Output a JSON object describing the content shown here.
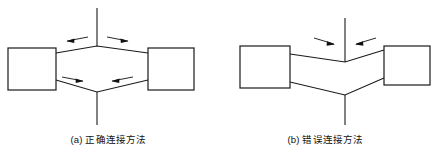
{
  "figure": {
    "background_color": "#ffffff",
    "line_color": "#1a1a1a",
    "arrow_color": "#111111",
    "width": 434,
    "height": 158
  },
  "panels": [
    {
      "id": "a",
      "caption": "(a) 正确连接方法",
      "diagram_type": "pipe-connection-schematic",
      "junction_shape": "diamond",
      "description_parts": {
        "left_box": "equipment-box-left",
        "right_box": "equipment-box-right",
        "top_riser": "vertical-pipe-top",
        "bottom_riser": "vertical-pipe-bottom"
      },
      "flow_arrows": [
        {
          "name": "top-left-arrow",
          "direction": "left",
          "position": "upper-left-branch"
        },
        {
          "name": "top-right-arrow",
          "direction": "right",
          "position": "upper-right-branch"
        },
        {
          "name": "bottom-left-arrow",
          "direction": "right",
          "position": "lower-left-branch"
        },
        {
          "name": "bottom-right-arrow",
          "direction": "left",
          "position": "lower-right-branch"
        }
      ]
    },
    {
      "id": "b",
      "caption": "(b) 错误连接方法",
      "diagram_type": "pipe-connection-schematic",
      "junction_shape": "double-vee",
      "description_parts": {
        "left_box": "equipment-box-left",
        "right_box": "equipment-box-right",
        "top_riser": "vertical-pipe-top",
        "bottom_riser": "vertical-pipe-bottom"
      },
      "flow_arrows": [
        {
          "name": "top-left-arrow",
          "direction": "right",
          "position": "upper-left-branch"
        },
        {
          "name": "top-right-arrow",
          "direction": "left",
          "position": "upper-right-branch"
        }
      ]
    }
  ]
}
